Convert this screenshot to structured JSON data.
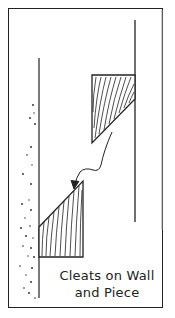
{
  "figure": {
    "caption_line1": "Cleats on Wall",
    "caption_line2": "and Piece",
    "elements": {
      "upper_cleat": "cleat attached to piece (hatched wood grain, wedge shape)",
      "lower_cleat": "cleat attached to wall (hatched, wedge shape)",
      "arrow": "curved arrow indicating piece lowered onto wall cleat",
      "wall": "stippled wall surface on left",
      "piece": "vertical piece lines on right"
    },
    "colors": {
      "ink": "#222222",
      "background": "#ffffff"
    }
  }
}
